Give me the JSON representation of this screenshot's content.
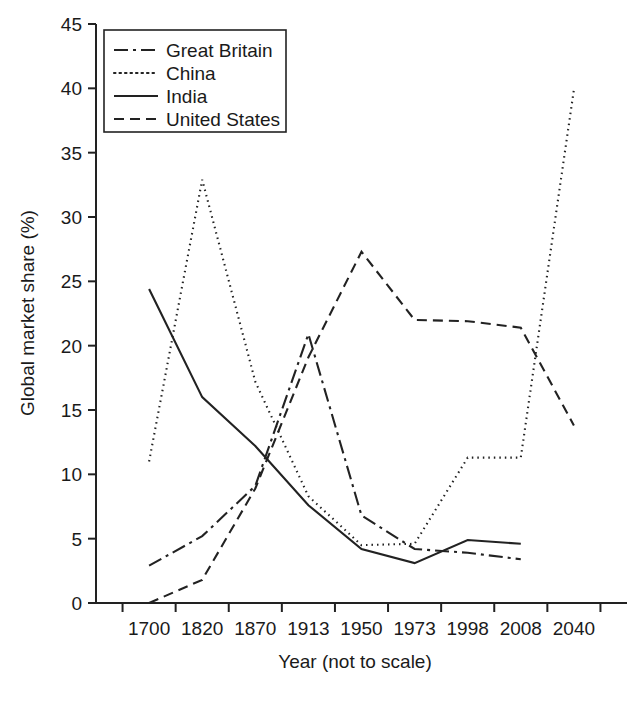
{
  "chart_data": {
    "type": "line",
    "title": "",
    "subtitle": "",
    "xlabel": "Year (not to scale)",
    "ylabel": "Global market share (%)",
    "categories": [
      "1700",
      "1820",
      "1870",
      "1913",
      "1950",
      "1973",
      "1998",
      "2008",
      "2040"
    ],
    "x_ticks": [
      "1700",
      "1820",
      "1870",
      "1913",
      "1950",
      "1973",
      "1998",
      "2008",
      "2040"
    ],
    "y_ticks": [
      0,
      5,
      10,
      15,
      20,
      25,
      30,
      35,
      40,
      45
    ],
    "ylim": [
      0,
      45
    ],
    "grid": false,
    "legend_position": "top-left",
    "series": [
      {
        "name": "Great Britain",
        "style": "dash-dot",
        "dasharray": "14,5,3,5",
        "values": [
          2.9,
          5.2,
          9.1,
          20.9,
          6.8,
          4.2,
          3.9,
          3.4,
          null
        ]
      },
      {
        "name": "China",
        "style": "dotted",
        "dasharray": "1.5,4",
        "values": [
          11.0,
          32.9,
          17.2,
          8.3,
          4.5,
          4.6,
          11.3,
          11.3,
          39.9
        ]
      },
      {
        "name": "India",
        "style": "solid",
        "dasharray": "none",
        "values": [
          24.4,
          16.0,
          12.2,
          7.6,
          4.2,
          3.1,
          4.9,
          4.6,
          null
        ]
      },
      {
        "name": "United States",
        "style": "dashed",
        "dasharray": "10,6",
        "values": [
          0.0,
          1.8,
          8.9,
          19.1,
          27.3,
          22.0,
          21.9,
          21.4,
          13.8
        ]
      }
    ]
  },
  "colors": {
    "axis": "#222222",
    "line": "#222222",
    "background": "#ffffff"
  }
}
